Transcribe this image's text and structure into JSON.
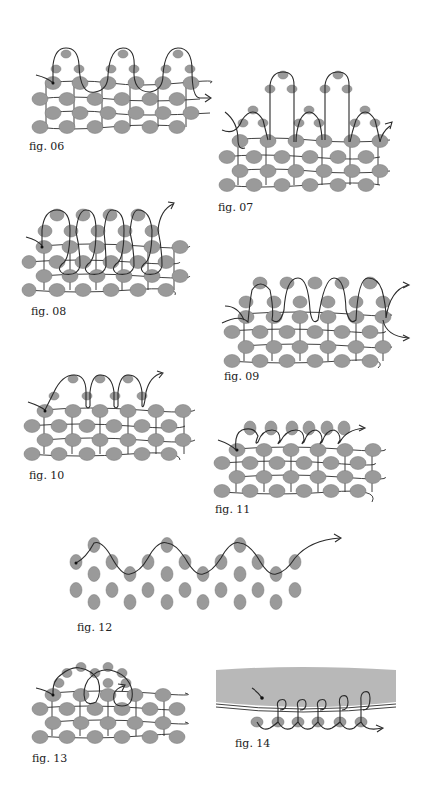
{
  "page": {
    "background": "#ffffff"
  },
  "colors": {
    "bead": "#9a9a9a",
    "bead_light": "#c9c9c9",
    "bead_dark": "#6e6e6e",
    "thread": "#2b2b2b",
    "fabric": "#b8b8b8",
    "caption": "#222222"
  },
  "figures": [
    {
      "id": "fig06",
      "caption": "fig. 06",
      "stitch": "three-bead picot loops across top row"
    },
    {
      "id": "fig07",
      "caption": "fig. 07",
      "stitch": "alternating short and tall picot loops"
    },
    {
      "id": "fig08",
      "caption": "fig. 08",
      "stitch": "overlapping loop fringe"
    },
    {
      "id": "fig09",
      "caption": "fig. 09",
      "stitch": "continuous arch loops with double exit"
    },
    {
      "id": "fig10",
      "caption": "fig. 10",
      "stitch": "spaced picot loops"
    },
    {
      "id": "fig11",
      "caption": "fig. 11",
      "stitch": "whip-stitch edging with single beads"
    },
    {
      "id": "fig12",
      "caption": "fig. 12",
      "stitch": "zigzag thread path through staggered beads"
    },
    {
      "id": "fig13",
      "caption": "fig. 13",
      "stitch": "overlapping large arches"
    },
    {
      "id": "fig14",
      "caption": "fig. 14",
      "stitch": "beaded edging stitched onto fabric"
    }
  ]
}
